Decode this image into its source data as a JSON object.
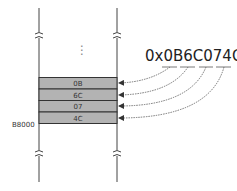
{
  "diagram": {
    "hex_value": "0x0B6C074C",
    "base_address": "B8000",
    "ellipsis": "⋮",
    "cells": [
      {
        "label": "0B",
        "byte_index": 0
      },
      {
        "label": "6C",
        "byte_index": 1
      },
      {
        "label": "07",
        "byte_index": 2
      },
      {
        "label": "4C",
        "byte_index": 3
      }
    ],
    "colors": {
      "cell_fill": "#b3b3b3",
      "line": "#333333",
      "arrow": "#444444"
    }
  }
}
